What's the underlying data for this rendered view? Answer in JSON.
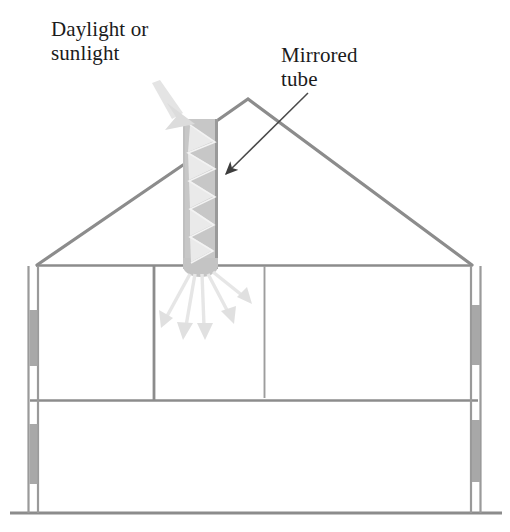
{
  "diagram": {
    "labels": {
      "daylight": "Daylight or\nsunlight",
      "mirrored_tube": "Mirrored\ntube"
    },
    "colors": {
      "outline": "#8c8c8c",
      "outline_dark": "#6f6f6f",
      "tube_fill": "#c9c9c9",
      "tube_edge": "#9a9a9a",
      "light_ray": "#e2e2e2",
      "light_ray_dark": "#d2d2d2",
      "window_fill": "#a8a8a8",
      "text": "#1b1b1b",
      "arrow_stroke": "#4a4a4a",
      "background": "#ffffff"
    },
    "elements": [
      {
        "name": "roof",
        "type": "gable-roof",
        "peak_x": 248,
        "peak_y": 99,
        "eave_left_x": 37,
        "eave_right_x": 472,
        "eave_y": 265
      },
      {
        "name": "mirrored-tube",
        "type": "vertical-duct",
        "left_x": 183,
        "right_x": 218,
        "top_y": 119,
        "bottom_y": 272
      },
      {
        "name": "ceiling-line",
        "type": "horizontal-line",
        "y": 265,
        "from_x": 37,
        "to_x": 472
      },
      {
        "name": "floor-divider",
        "type": "horizontal-line",
        "y": 400,
        "from_x": 30,
        "to_x": 478
      },
      {
        "name": "ground-line",
        "type": "horizontal-line",
        "y": 513,
        "from_x": 10,
        "to_x": 502
      },
      {
        "name": "left-exterior-wall",
        "type": "double-wall",
        "x": 33,
        "top_y": 265,
        "bottom_y": 513
      },
      {
        "name": "right-exterior-wall",
        "type": "double-wall",
        "x": 470,
        "top_y": 265,
        "bottom_y": 513
      },
      {
        "name": "left-partition-wall",
        "type": "interior-wall",
        "x": 154,
        "top_y": 265,
        "bottom_y": 400
      },
      {
        "name": "right-partition-wall",
        "type": "interior-wall",
        "x": 264,
        "top_y": 265,
        "bottom_y": 398
      },
      {
        "name": "sunlight-arrow",
        "type": "tapered-arrow",
        "from_x": 155,
        "from_y": 86,
        "to_x": 193,
        "to_y": 125
      },
      {
        "name": "zigzag-light-path",
        "type": "reflection-path",
        "bounces": 5
      },
      {
        "name": "diffused-light-rays",
        "type": "fan-arrows",
        "count": 5,
        "origin_x": 200,
        "origin_y": 272
      },
      {
        "name": "mirrored-tube-leader-arrow",
        "type": "thin-arrow",
        "from_x": 306,
        "from_y": 94,
        "to_x": 224,
        "to_y": 175
      }
    ]
  }
}
